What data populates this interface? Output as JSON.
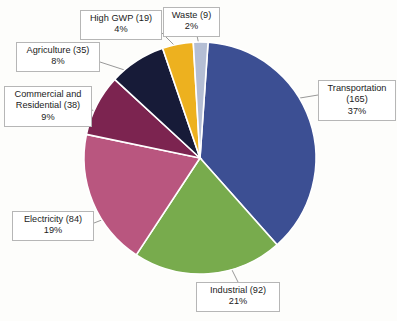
{
  "chart_data": {
    "type": "pie",
    "title": "",
    "xlabel": "",
    "ylabel": "",
    "legend_position": "none",
    "grid": false,
    "total": 442,
    "units": "MMT CO2e",
    "start_angle_deg": 4,
    "direction": "clockwise",
    "categories": [
      "Transportation",
      "Industrial",
      "Electricity",
      "Commercial and Residential",
      "Agriculture",
      "High GWP",
      "Waste"
    ],
    "values": [
      165,
      92,
      84,
      38,
      35,
      19,
      9
    ],
    "percents": [
      37,
      21,
      19,
      9,
      8,
      4,
      2
    ],
    "colors": [
      "#3c4f93",
      "#78ab4d",
      "#b9567f",
      "#7c2450",
      "#171b38",
      "#edb11f",
      "#b4bed4"
    ],
    "slices": [
      {
        "name": "Transportation",
        "value": 165,
        "percent": 37,
        "color": "#3c4f93",
        "label_lines": [
          "Transportation",
          "(165)",
          "37%"
        ]
      },
      {
        "name": "Industrial",
        "value": 92,
        "percent": 21,
        "color": "#78ab4d",
        "label_lines": [
          "Industrial (92)",
          "21%"
        ]
      },
      {
        "name": "Electricity",
        "value": 84,
        "percent": 19,
        "color": "#b9567f",
        "label_lines": [
          "Electricity (84)",
          "19%"
        ]
      },
      {
        "name": "Commercial and Residential",
        "value": 38,
        "percent": 9,
        "color": "#7c2450",
        "label_lines": [
          "Commercial and",
          "Residential (38)",
          "9%"
        ]
      },
      {
        "name": "Agriculture",
        "value": 35,
        "percent": 8,
        "color": "#171b38",
        "label_lines": [
          "Agriculture (35)",
          "8%"
        ]
      },
      {
        "name": "High GWP",
        "value": 19,
        "percent": 4,
        "color": "#edb11f",
        "label_lines": [
          "High GWP (19)",
          "4%"
        ]
      },
      {
        "name": "Waste",
        "value": 9,
        "percent": 2,
        "color": "#b4bed4",
        "label_lines": [
          "Waste (9)",
          "2%"
        ]
      }
    ]
  },
  "callouts": {
    "transportation": {
      "line1": "Transportation",
      "line2": "(165)",
      "line3": "37%"
    },
    "industrial": {
      "line1": "Industrial (92)",
      "line2": "21%"
    },
    "electricity": {
      "line1": "Electricity (84)",
      "line2": "19%"
    },
    "commercial": {
      "line1": "Commercial and",
      "line2": "Residential (38)",
      "line3": "9%"
    },
    "agriculture": {
      "line1": "Agriculture (35)",
      "line2": "8%"
    },
    "highgwp": {
      "line1": "High GWP (19)",
      "line2": "4%"
    },
    "waste": {
      "line1": "Waste (9)",
      "line2": "2%"
    }
  }
}
